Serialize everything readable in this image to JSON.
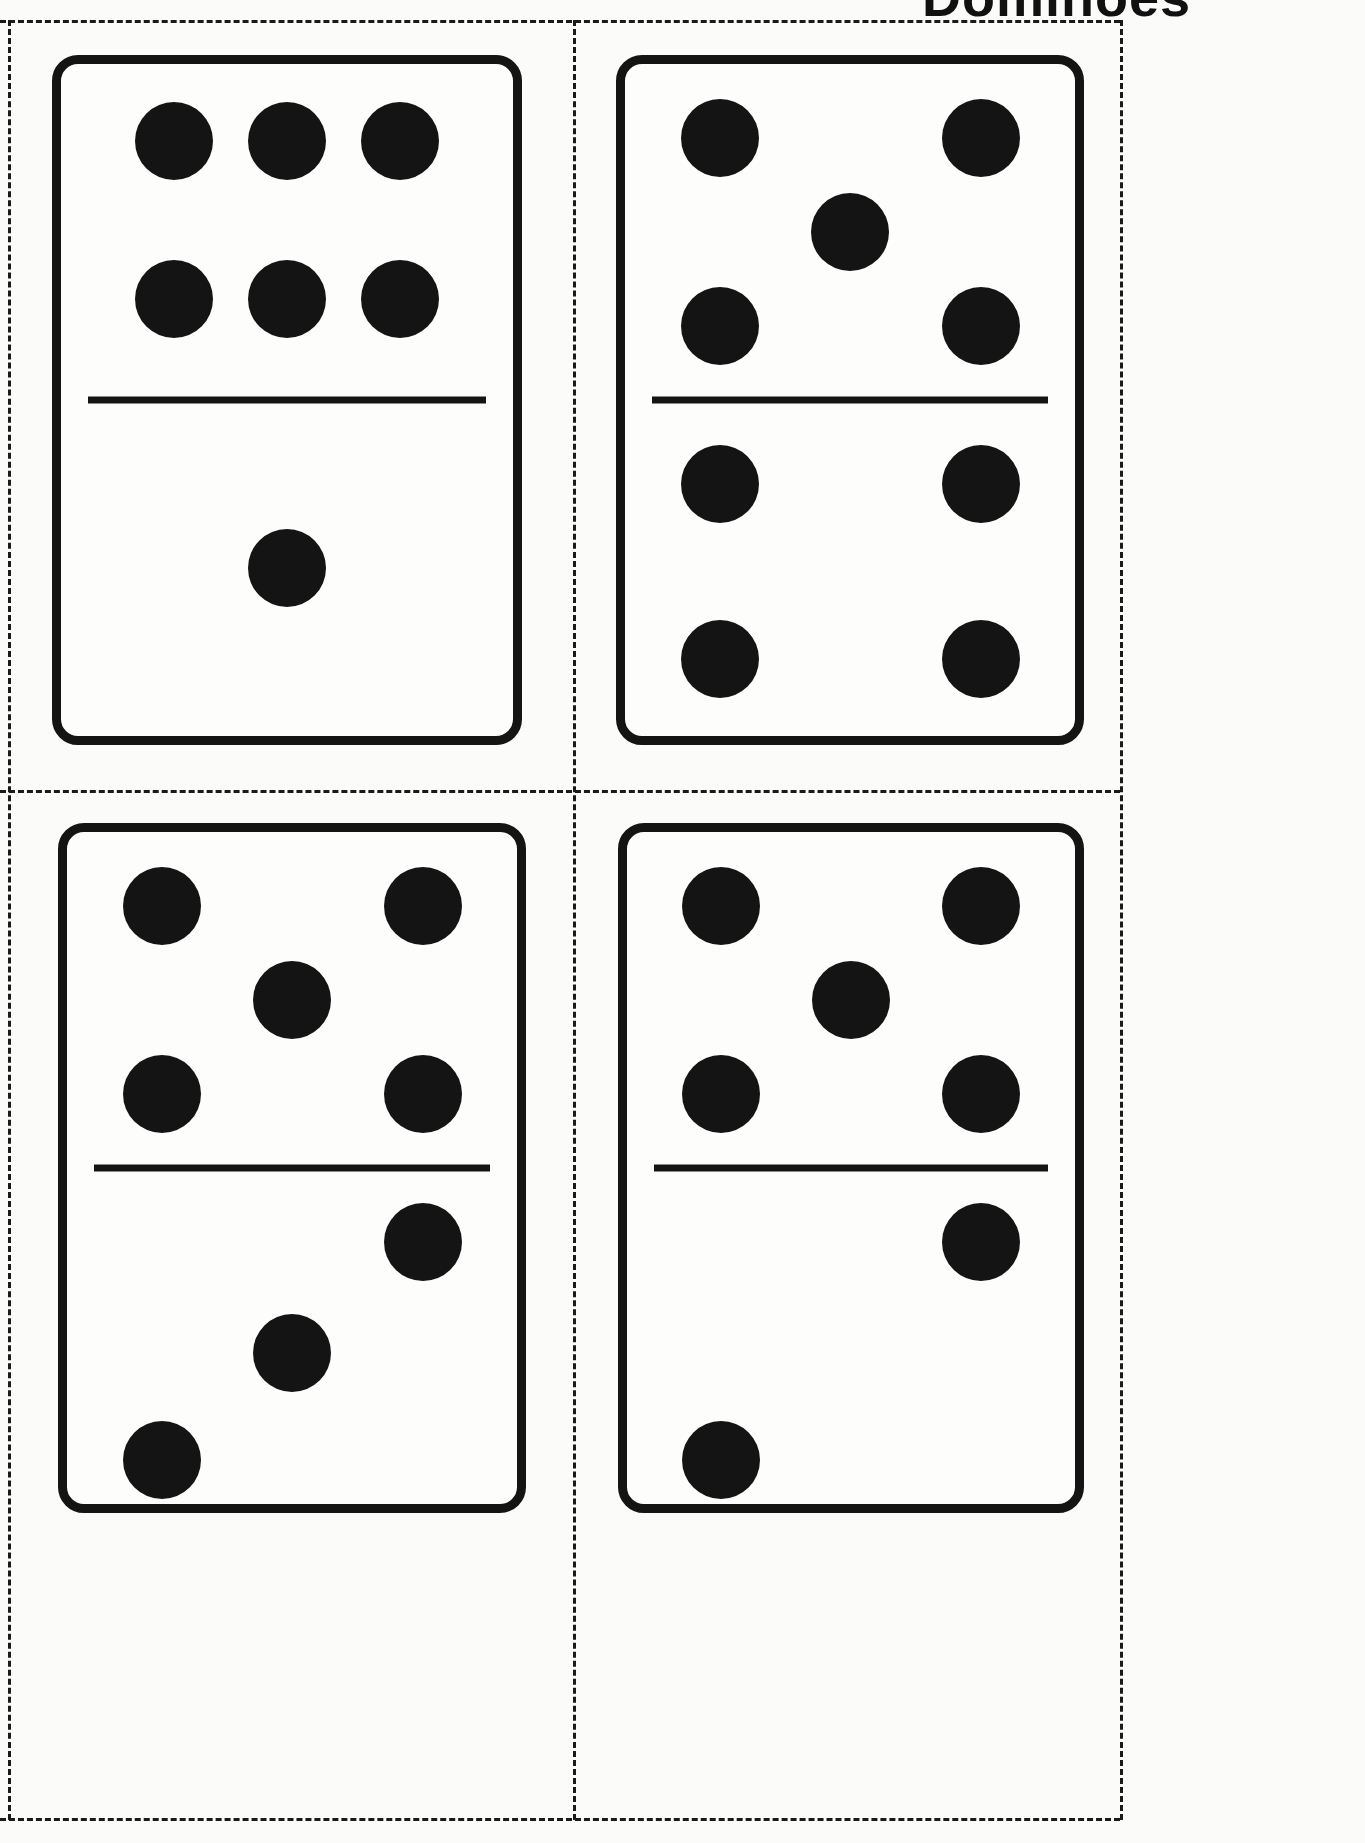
{
  "page": {
    "title": "Dominoes",
    "background_color": "#fbfbf9",
    "ink_color": "#141414",
    "width": 1365,
    "height": 1843
  },
  "cut_grid": {
    "style": "dashed",
    "color": "#1a1a1a",
    "rows": 2,
    "columns": 2
  },
  "dominoes": [
    {
      "id": "domino-6-1",
      "position": "top-left",
      "top_value": 6,
      "bottom_value": 1,
      "total": 7,
      "top_pips": [
        {
          "x": 25,
          "y": 23
        },
        {
          "x": 50,
          "y": 23
        },
        {
          "x": 75,
          "y": 23
        },
        {
          "x": 25,
          "y": 70
        },
        {
          "x": 50,
          "y": 70
        },
        {
          "x": 75,
          "y": 70
        }
      ],
      "bottom_pips": [
        {
          "x": 50,
          "y": 50
        }
      ]
    },
    {
      "id": "domino-5-4",
      "position": "top-right",
      "top_value": 5,
      "bottom_value": 4,
      "total": 9,
      "top_pips": [
        {
          "x": 21,
          "y": 22
        },
        {
          "x": 79,
          "y": 22
        },
        {
          "x": 50,
          "y": 50
        },
        {
          "x": 21,
          "y": 78
        },
        {
          "x": 79,
          "y": 78
        }
      ],
      "bottom_pips": [
        {
          "x": 21,
          "y": 25
        },
        {
          "x": 79,
          "y": 25
        },
        {
          "x": 21,
          "y": 77
        },
        {
          "x": 79,
          "y": 77
        }
      ]
    },
    {
      "id": "domino-5-3",
      "position": "bottom-left",
      "top_value": 5,
      "bottom_value": 3,
      "total": 8,
      "top_pips": [
        {
          "x": 21,
          "y": 22
        },
        {
          "x": 79,
          "y": 22
        },
        {
          "x": 50,
          "y": 50
        },
        {
          "x": 21,
          "y": 78
        },
        {
          "x": 79,
          "y": 78
        }
      ],
      "bottom_pips": [
        {
          "x": 79,
          "y": 22
        },
        {
          "x": 50,
          "y": 55
        },
        {
          "x": 21,
          "y": 87
        }
      ]
    },
    {
      "id": "domino-5-2",
      "position": "bottom-right",
      "top_value": 5,
      "bottom_value": 2,
      "total": 7,
      "top_pips": [
        {
          "x": 21,
          "y": 22
        },
        {
          "x": 79,
          "y": 22
        },
        {
          "x": 50,
          "y": 50
        },
        {
          "x": 21,
          "y": 78
        },
        {
          "x": 79,
          "y": 78
        }
      ],
      "bottom_pips": [
        {
          "x": 79,
          "y": 22
        },
        {
          "x": 21,
          "y": 87
        }
      ]
    }
  ]
}
